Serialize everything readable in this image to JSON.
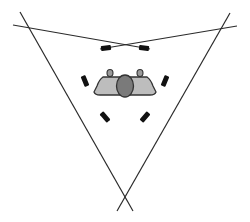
{
  "diagram": {
    "listener": {
      "label": "",
      "head_color": "#7a7a7a",
      "body_color": "#bdbdbd",
      "ear_color": "#9a9a9a"
    },
    "speaker_pairs": [
      {
        "name": "front-pair",
        "speakers": [
          "front-left-speaker",
          "front-right-speaker"
        ]
      },
      {
        "name": "left-pair",
        "speakers": [
          "left-upper-speaker",
          "left-lower-speaker"
        ]
      },
      {
        "name": "right-pair",
        "speakers": [
          "right-upper-speaker",
          "right-lower-speaker"
        ]
      }
    ],
    "line_color": "#2a2a2a",
    "speaker_color": "#111111"
  }
}
